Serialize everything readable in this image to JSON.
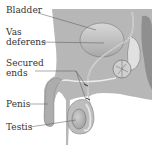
{
  "diagram": {
    "type": "anatomical-illustration",
    "colors": {
      "background": "#ffffff",
      "body": "#b7b7b7",
      "body_dark": "#9a9a9a",
      "organ_light": "#d4d4d4",
      "outline": "#6a6a6a",
      "label_text": "#333333",
      "leader_line": "#555555"
    },
    "labels": [
      {
        "id": "bladder",
        "line1": "Bladder",
        "line2": ""
      },
      {
        "id": "vas-deferens",
        "line1": "Vas",
        "line2": "deferens"
      },
      {
        "id": "secured-ends",
        "line1": "Secured",
        "line2": "ends"
      },
      {
        "id": "penis",
        "line1": "Penis",
        "line2": ""
      },
      {
        "id": "testis",
        "line1": "Testis",
        "line2": ""
      }
    ]
  }
}
